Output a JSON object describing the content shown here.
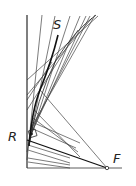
{
  "diagram": {
    "type": "geometric-construction",
    "labels": {
      "S": "S",
      "R": "R",
      "F": "F"
    },
    "colors": {
      "line": "#333333",
      "background": "#ffffff"
    },
    "points": {
      "F": [
        107,
        168
      ],
      "R": [
        27,
        140
      ],
      "S_label": [
        56,
        27
      ]
    }
  }
}
